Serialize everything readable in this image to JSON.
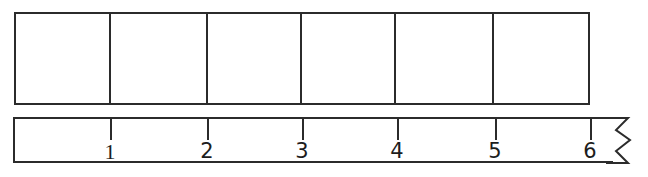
{
  "diagram": {
    "line_color": "#2b2b2b",
    "background_color": "#ffffff",
    "bar_model": {
      "name": "bar-model",
      "cell_count": 6,
      "cells": [
        {
          "label": "",
          "width_px": 96
        },
        {
          "label": "",
          "width_px": 97
        },
        {
          "label": "",
          "width_px": 95
        },
        {
          "label": "",
          "width_px": 95
        },
        {
          "label": "",
          "width_px": 98
        },
        {
          "label": "",
          "width_px": 95
        }
      ]
    },
    "number_line": {
      "name": "number-line",
      "has_break": true,
      "break_symbol": "zigzag",
      "ticks": [
        {
          "label": "1",
          "x": 110
        },
        {
          "label": "2",
          "x": 207
        },
        {
          "label": "3",
          "x": 302
        },
        {
          "label": "4",
          "x": 397
        },
        {
          "label": "5",
          "x": 495
        },
        {
          "label": "6",
          "x": 590
        }
      ]
    }
  }
}
